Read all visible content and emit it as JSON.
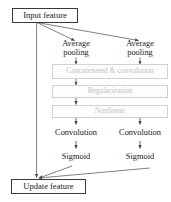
{
  "diagram": {
    "colors": {
      "stroke_dark": "#3a3a3a",
      "stroke_gray": "#d2d2d2",
      "text_dark": "#1a1a1a",
      "text_gray": "#c2c2c2",
      "background": "#ffffff"
    },
    "nodes": {
      "input_feature": {
        "label": "Input feature",
        "style": "solid-box"
      },
      "avg_pool_left": {
        "label_line1": "Average",
        "label_line2": "pooling",
        "style": "plain-text"
      },
      "avg_pool_right": {
        "label_line1": "Average",
        "label_line2": "pooling",
        "style": "plain-text"
      },
      "concat_conv": {
        "label": "Concatenated & convolution",
        "style": "gray-box"
      },
      "regularization": {
        "label": "Regularization",
        "style": "gray-box"
      },
      "nonlinear": {
        "label": "Nonlinear",
        "style": "gray-box"
      },
      "conv_left": {
        "label": "Convolution",
        "style": "plain-text"
      },
      "conv_right": {
        "label": "Convolution",
        "style": "plain-text"
      },
      "sigmoid_left": {
        "label": "Sigmoid",
        "style": "plain-text"
      },
      "sigmoid_right": {
        "label": "Sigmoid",
        "style": "plain-text"
      },
      "update_feature": {
        "label": "Update feature",
        "style": "solid-box"
      }
    },
    "edges": [
      {
        "name": "input-to-avgpool-left",
        "from": "input_feature",
        "to": "avg_pool_left",
        "kind": "diagonal-arrow"
      },
      {
        "name": "input-to-avgpool-right",
        "from": "input_feature",
        "to": "avg_pool_right",
        "kind": "diagonal-arrow"
      },
      {
        "name": "skip-connection",
        "from": "input_feature",
        "to": "update_feature",
        "kind": "vertical-line-arrow"
      },
      {
        "name": "avgpool-left-to-concat",
        "from": "avg_pool_left",
        "to": "concat_conv",
        "kind": "vertical-arrow"
      },
      {
        "name": "avgpool-right-to-concat",
        "from": "avg_pool_right",
        "to": "concat_conv",
        "kind": "vertical-arrow"
      },
      {
        "name": "concat-to-regularization",
        "from": "concat_conv",
        "to": "regularization",
        "kind": "vertical-arrow"
      },
      {
        "name": "regularization-to-nonlinear",
        "from": "regularization",
        "to": "nonlinear",
        "kind": "vertical-arrow"
      },
      {
        "name": "nonlinear-to-conv-left",
        "from": "nonlinear",
        "to": "conv_left",
        "kind": "vertical-arrow"
      },
      {
        "name": "nonlinear-to-conv-right",
        "from": "nonlinear",
        "to": "conv_right",
        "kind": "vertical-arrow"
      },
      {
        "name": "conv-left-to-sigmoid-left",
        "from": "conv_left",
        "to": "sigmoid_left",
        "kind": "vertical-arrow"
      },
      {
        "name": "conv-right-to-sigmoid-right",
        "from": "conv_right",
        "to": "sigmoid_right",
        "kind": "vertical-arrow"
      },
      {
        "name": "sigmoid-left-to-update",
        "from": "sigmoid_left",
        "to": "update_feature",
        "kind": "diagonal-arrow"
      },
      {
        "name": "sigmoid-right-to-update",
        "from": "sigmoid_right",
        "to": "update_feature",
        "kind": "diagonal-arrow"
      }
    ]
  }
}
